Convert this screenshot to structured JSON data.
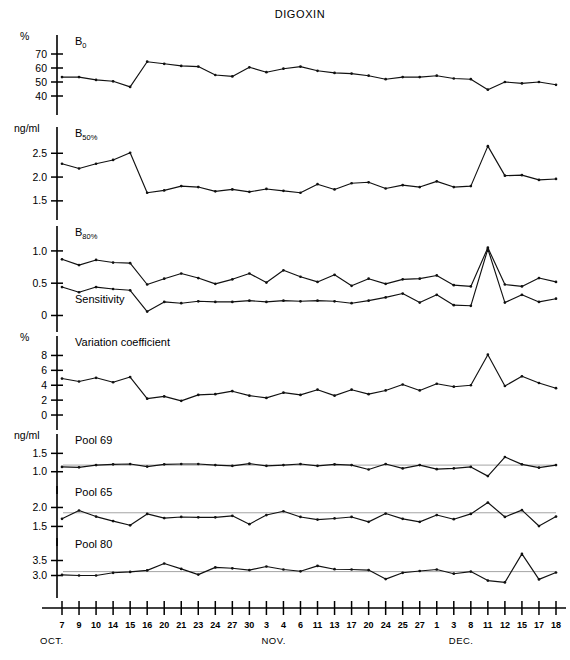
{
  "chart_data": {
    "type": "line",
    "title": "DIGOXIN",
    "xlabel": "",
    "ylabel": "",
    "grid": false,
    "legend_position": "inline-panel-labels",
    "x_tick_labels": [
      "7",
      "9",
      "10",
      "14",
      "15",
      "16",
      "20",
      "21",
      "23",
      "24",
      "27",
      "30",
      "3",
      "4",
      "6",
      "11",
      "13",
      "17",
      "20",
      "24",
      "25",
      "27",
      "1",
      "3",
      "8",
      "11",
      "12",
      "15",
      "17",
      "18"
    ],
    "x_month_labels": [
      {
        "text": "OCT.",
        "at_index": 0
      },
      {
        "text": "NOV.",
        "at_index": 13
      },
      {
        "text": "DEC.",
        "at_index": 24
      }
    ],
    "n_points": 30,
    "panels": [
      {
        "id": "b0",
        "label": "B",
        "label_sub": "0",
        "unit": "%",
        "ylim": [
          35,
          75
        ],
        "yticks": [
          40,
          50,
          60,
          70
        ],
        "ytick_labels": [
          "40",
          "50",
          "60",
          "70"
        ],
        "series": [
          {
            "name": "B0",
            "values": [
              53.5,
              53.5,
              51.5,
              50.5,
              46.5,
              64.5,
              63.0,
              61.5,
              61.0,
              55.0,
              54.0,
              60.5,
              57.0,
              59.5,
              61.0,
              58.0,
              56.5,
              56.0,
              54.5,
              52.0,
              53.5,
              53.5,
              54.5,
              52.5,
              52.0,
              44.5,
              50.0,
              49.0,
              50.0,
              48.0
            ]
          }
        ]
      },
      {
        "id": "b50",
        "label": "B",
        "label_sub": "50%",
        "unit": "ng/ml",
        "ylim": [
          1.35,
          2.8
        ],
        "yticks": [
          1.5,
          2.0,
          2.5
        ],
        "ytick_labels": [
          "1.5",
          "2.0",
          "2.5"
        ],
        "series": [
          {
            "name": "B50%",
            "values": [
              2.28,
              2.18,
              2.28,
              2.36,
              2.51,
              1.67,
              1.72,
              1.81,
              1.79,
              1.7,
              1.74,
              1.69,
              1.75,
              1.71,
              1.67,
              1.85,
              1.74,
              1.87,
              1.89,
              1.76,
              1.83,
              1.79,
              1.91,
              1.79,
              1.81,
              2.65,
              2.03,
              2.04,
              1.94,
              1.96
            ]
          }
        ]
      },
      {
        "id": "b80",
        "label": "B",
        "label_sub": "80%",
        "unit": "",
        "second_label": "Sensitivity",
        "ylim": [
          -0.07,
          1.2
        ],
        "yticks": [
          0,
          0.5,
          1.0
        ],
        "ytick_labels": [
          "0",
          "0.5",
          "1.0"
        ],
        "series": [
          {
            "name": "B80%",
            "values": [
              0.87,
              0.78,
              0.86,
              0.82,
              0.81,
              0.48,
              0.57,
              0.65,
              0.58,
              0.49,
              0.56,
              0.65,
              0.51,
              0.7,
              0.6,
              0.52,
              0.63,
              0.46,
              0.57,
              0.49,
              0.56,
              0.57,
              0.62,
              0.47,
              0.45,
              1.05,
              0.48,
              0.45,
              0.58,
              0.52
            ]
          },
          {
            "name": "Sensitivity",
            "values": [
              0.44,
              0.36,
              0.44,
              0.41,
              0.39,
              0.06,
              0.21,
              0.19,
              0.22,
              0.21,
              0.21,
              0.23,
              0.21,
              0.23,
              0.22,
              0.23,
              0.22,
              0.19,
              0.23,
              0.28,
              0.34,
              0.2,
              0.32,
              0.16,
              0.15,
              1.03,
              0.2,
              0.32,
              0.21,
              0.26
            ]
          }
        ]
      },
      {
        "id": "cv",
        "label": "Variation coefficient",
        "label_sub": "",
        "unit": "%",
        "ylim": [
          -0.4,
          9.0
        ],
        "yticks": [
          0,
          2,
          4,
          6,
          8
        ],
        "ytick_labels": [
          "0",
          "2",
          "4",
          "6",
          "8"
        ],
        "series": [
          {
            "name": "Variation coefficient",
            "values": [
              4.9,
              4.5,
              5.0,
              4.4,
              5.1,
              2.2,
              2.5,
              1.9,
              2.7,
              2.8,
              3.2,
              2.6,
              2.3,
              3.0,
              2.7,
              3.4,
              2.6,
              3.4,
              2.8,
              3.3,
              4.1,
              3.3,
              4.2,
              3.8,
              4.0,
              8.1,
              3.9,
              5.2,
              4.3,
              3.6
            ]
          }
        ]
      },
      {
        "id": "pool69",
        "label": "Pool 69",
        "label_sub": "",
        "unit": "ng/ml",
        "ylim": [
          0.72,
          1.7
        ],
        "yticks": [
          1.0,
          1.5
        ],
        "ytick_labels": [
          "1.0",
          "1.5"
        ],
        "reference": 1.18,
        "series": [
          {
            "name": "Pool 69",
            "values": [
              1.13,
              1.12,
              1.18,
              1.2,
              1.21,
              1.14,
              1.2,
              1.21,
              1.21,
              1.18,
              1.16,
              1.22,
              1.16,
              1.18,
              1.21,
              1.16,
              1.2,
              1.18,
              1.06,
              1.21,
              1.09,
              1.18,
              1.07,
              1.09,
              1.13,
              0.88,
              1.4,
              1.2,
              1.11,
              1.18
            ]
          }
        ]
      },
      {
        "id": "pool65",
        "label": "Pool 65",
        "label_sub": "",
        "unit": "",
        "ylim": [
          1.3,
          2.25
        ],
        "yticks": [
          1.5,
          2.0
        ],
        "ytick_labels": [
          "1.5",
          "2.0"
        ],
        "reference": 1.86,
        "series": [
          {
            "name": "Pool 65",
            "values": [
              1.7,
              1.92,
              1.76,
              1.64,
              1.53,
              1.83,
              1.72,
              1.75,
              1.74,
              1.74,
              1.78,
              1.56,
              1.8,
              1.9,
              1.75,
              1.68,
              1.71,
              1.75,
              1.62,
              1.84,
              1.7,
              1.62,
              1.8,
              1.69,
              1.83,
              2.13,
              1.75,
              1.93,
              1.51,
              1.76
            ]
          }
        ]
      },
      {
        "id": "pool80",
        "label": "Pool 80",
        "label_sub": "",
        "unit": "",
        "ylim": [
          2.65,
          3.85
        ],
        "yticks": [
          3.0,
          3.5
        ],
        "ytick_labels": [
          "3.0",
          "3.5"
        ],
        "reference": 3.13,
        "series": [
          {
            "name": "Pool 80",
            "values": [
              3.02,
              3.0,
              3.0,
              3.09,
              3.12,
              3.17,
              3.4,
              3.22,
              3.03,
              3.27,
              3.24,
              3.18,
              3.3,
              3.2,
              3.14,
              3.32,
              3.21,
              3.2,
              3.18,
              2.88,
              3.09,
              3.15,
              3.2,
              3.06,
              3.13,
              2.83,
              2.77,
              3.72,
              2.87,
              3.1
            ]
          }
        ]
      }
    ]
  },
  "figure": {
    "title": "DIGOXIN",
    "axis_caption_months": [
      "OCT.",
      "NOV.",
      "DEC."
    ]
  }
}
